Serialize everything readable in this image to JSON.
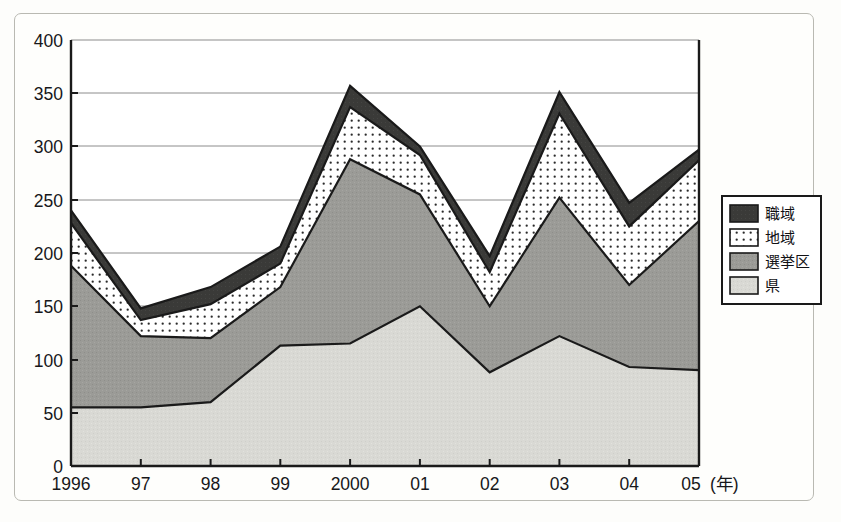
{
  "chart_data": {
    "type": "area",
    "stacked": true,
    "title": "",
    "subtitle": "",
    "xlabel": "(年)",
    "ylabel": "",
    "categories": [
      "1996",
      "97",
      "98",
      "99",
      "2000",
      "01",
      "02",
      "03",
      "04",
      "05"
    ],
    "x_tick_labels": [
      "1996",
      "97",
      "98",
      "99",
      "2000",
      "01",
      "02",
      "03",
      "04",
      "05"
    ],
    "x_axis_unit_label": "(年)",
    "y_tick_labels": [
      "0",
      "50",
      "100",
      "150",
      "200",
      "250",
      "300",
      "350",
      "400"
    ],
    "y_ticks": [
      0,
      50,
      100,
      150,
      200,
      250,
      300,
      350,
      400
    ],
    "ylim": [
      0,
      400
    ],
    "grid": "horizontal",
    "legend_position": "right-outside",
    "series": [
      {
        "name": "県",
        "legend_label": "県",
        "order": 1,
        "fill": "#d9d9d4",
        "pattern": "solid-light",
        "values": [
          55,
          55,
          60,
          113,
          115,
          150,
          88,
          122,
          93,
          90
        ],
        "cumulative": [
          55,
          55,
          60,
          113,
          115,
          150,
          88,
          122,
          93,
          90
        ]
      },
      {
        "name": "選挙区",
        "legend_label": "選挙区",
        "order": 2,
        "fill": "#9b9b97",
        "pattern": "solid-gray",
        "values": [
          133,
          67,
          60,
          55,
          173,
          105,
          62,
          130,
          77,
          140
        ],
        "cumulative": [
          188,
          122,
          120,
          168,
          288,
          255,
          150,
          252,
          170,
          230
        ]
      },
      {
        "name": "地域",
        "legend_label": "地域",
        "order": 3,
        "fill": "#ffffff",
        "pattern": "dotted",
        "values": [
          40,
          15,
          32,
          22,
          49,
          37,
          32,
          79,
          55,
          57
        ],
        "cumulative": [
          228,
          137,
          152,
          190,
          337,
          292,
          182,
          331,
          225,
          287
        ]
      },
      {
        "name": "職域",
        "legend_label": "職域",
        "order": 4,
        "fill": "#3a3a38",
        "pattern": "solid-dark",
        "values": [
          12,
          11,
          16,
          16,
          20,
          8,
          15,
          20,
          22,
          10
        ],
        "cumulative": [
          240,
          148,
          168,
          206,
          357,
          300,
          197,
          351,
          247,
          297
        ]
      }
    ],
    "totals": [
      240,
      148,
      168,
      206,
      357,
      300,
      197,
      351,
      247,
      297
    ]
  },
  "legend": {
    "items": [
      {
        "label": "職域",
        "swatch": "dark"
      },
      {
        "label": "地域",
        "swatch": "dotted"
      },
      {
        "label": "選挙区",
        "swatch": "gray"
      },
      {
        "label": "県",
        "swatch": "light"
      }
    ]
  },
  "axis": {
    "y_400": "400",
    "y_350": "350",
    "y_300": "300",
    "y_250": "250",
    "y_200": "200",
    "y_150": "150",
    "y_100": "100",
    "y_50": "50",
    "y_0": "0",
    "x_1996": "1996",
    "x_97": "97",
    "x_98": "98",
    "x_99": "99",
    "x_2000": "2000",
    "x_01": "01",
    "x_02": "02",
    "x_03": "03",
    "x_04": "04",
    "x_05": "05",
    "x_unit": "(年)"
  },
  "colors": {
    "dark": "#3a3a38",
    "gray": "#9b9b97",
    "light": "#d9d9d4",
    "dots_bg": "#ffffff",
    "stroke": "#1a1a1a",
    "grid": "#8c8c8c",
    "frame": "#b9b9b2"
  }
}
